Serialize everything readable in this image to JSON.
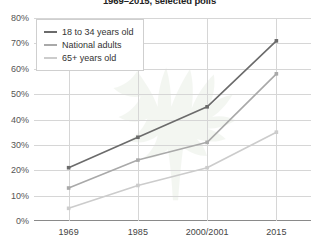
{
  "chart_data": {
    "type": "line",
    "title": "1969–2015, selected polls",
    "xlabel": "",
    "ylabel": "",
    "categories": [
      "1969",
      "1985",
      "2000/2001",
      "2015"
    ],
    "ylim": [
      0,
      80
    ],
    "yticks": [
      0,
      10,
      20,
      30,
      40,
      50,
      60,
      70,
      80
    ],
    "ytick_labels": [
      "0%",
      "10%",
      "20%",
      "30%",
      "40%",
      "50%",
      "60%",
      "70%",
      "80%"
    ],
    "grid": true,
    "legend_position": "top-left",
    "series": [
      {
        "name": "18 to 34 years old",
        "color": "#6b6b6b",
        "values": [
          21,
          33,
          45,
          71
        ]
      },
      {
        "name": "National adults",
        "color": "#a9a9a9",
        "values": [
          13,
          24,
          31,
          58
        ]
      },
      {
        "name": "65+ years old",
        "color": "#cccccc",
        "values": [
          5,
          14,
          21,
          35
        ]
      }
    ],
    "watermark": "cannabis-leaf"
  },
  "legend": {
    "items": [
      {
        "label": "18 to 34 years old"
      },
      {
        "label": "National adults"
      },
      {
        "label": "65+ years old"
      }
    ]
  }
}
